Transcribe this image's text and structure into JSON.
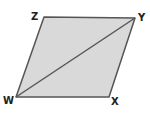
{
  "diagram": {
    "shape": "parallelogram",
    "fill": "#d9d9d9",
    "stroke": "#555555",
    "vertices": [
      {
        "name": "Z",
        "x": 44,
        "y": 17,
        "label_x": 31,
        "label_y": 20
      },
      {
        "name": "Y",
        "x": 135,
        "y": 18,
        "label_x": 138,
        "label_y": 21
      },
      {
        "name": "X",
        "x": 109,
        "y": 97,
        "label_x": 111,
        "label_y": 105
      },
      {
        "name": "W",
        "x": 16,
        "y": 97,
        "label_x": 3,
        "label_y": 104
      }
    ],
    "diagonal": {
      "from": "W",
      "to": "Y"
    },
    "labels": {
      "z": "Z",
      "y": "Y",
      "x": "X",
      "w": "W"
    }
  }
}
